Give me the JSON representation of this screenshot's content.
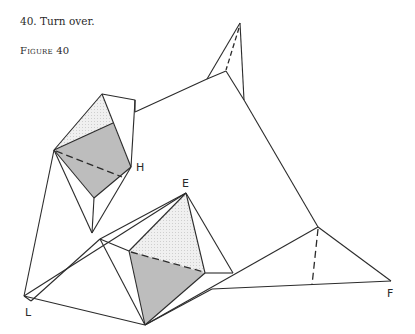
{
  "caption": "40. Turn over.",
  "figure": {
    "label": "Figure 40",
    "point_labels": {
      "H": "H",
      "E": "E",
      "L": "L",
      "F": "F"
    }
  },
  "colors": {
    "line": "#2b2b2b",
    "shaded": "#bdbdbd",
    "light_shaded": "#e8e8e8",
    "background": "#ffffff"
  }
}
